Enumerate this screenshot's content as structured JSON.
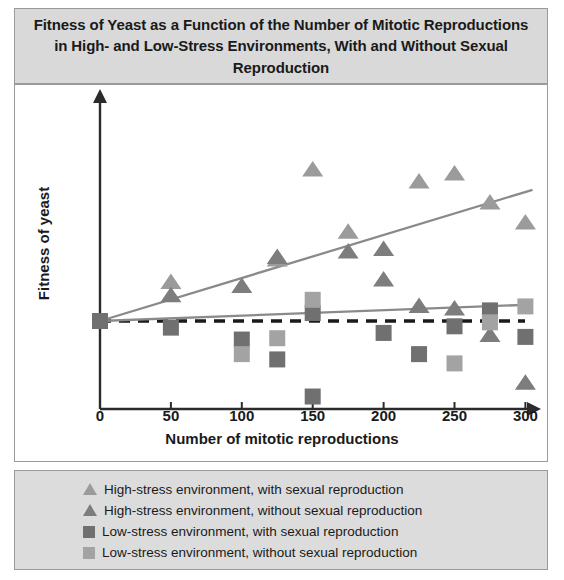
{
  "title": "Fitness of Yeast as a Function of the Number of Mitotic Reproductions in High- and Low-Stress Environments, With and Without Sexual Reproduction",
  "colors": {
    "high_with": "#9b9b9b",
    "high_without": "#7d7d7d",
    "low_with": "#707070",
    "low_without": "#a3a3a3",
    "trend_high": "#8a8a8a",
    "trend_low": "#8a8a8a",
    "baseline": "#1a1a1a",
    "axis": "#2b2b2b",
    "panel_title_bg": "#d9d9d9",
    "panel_legend_bg": "#dcdcdc",
    "panel_border": "#9a9a9a"
  },
  "legend": {
    "items": [
      {
        "marker": "triangle-icon",
        "color": "#9b9b9b",
        "label": "High-stress environment, with sexual reproduction"
      },
      {
        "marker": "triangle-icon",
        "color": "#7d7d7d",
        "label": "High-stress environment, without sexual reproduction"
      },
      {
        "marker": "square-icon",
        "color": "#707070",
        "label": "Low-stress environment, with sexual reproduction"
      },
      {
        "marker": "square-icon",
        "color": "#a3a3a3",
        "label": "Low-stress environment, without sexual reproduction"
      }
    ]
  },
  "chart_data": {
    "type": "scatter",
    "title": "Fitness of Yeast as a Function of the Number of Mitotic Reproductions in High- and Low-Stress Environments, With and Without Sexual Reproduction",
    "xlabel": "Number of mitotic reproductions",
    "ylabel": "Fitness of yeast",
    "xlim": [
      0,
      315
    ],
    "ylim": [
      -3.1,
      6.2
    ],
    "xticks": [
      0,
      50,
      100,
      150,
      200,
      250,
      300
    ],
    "yticks": [],
    "grid": false,
    "legend_position": "bottom",
    "baseline": {
      "value": 0,
      "style": "dashed",
      "label": "initial fitness"
    },
    "series": [
      {
        "name": "High-stress environment, with sexual reproduction",
        "marker": "triangle",
        "color": "#9b9b9b",
        "points": [
          {
            "x": 50,
            "y": 1.45
          },
          {
            "x": 125,
            "y": 2.3
          },
          {
            "x": 150,
            "y": 5.7
          },
          {
            "x": 175,
            "y": 3.35
          },
          {
            "x": 225,
            "y": 5.25
          },
          {
            "x": 250,
            "y": 5.55
          },
          {
            "x": 275,
            "y": 4.45
          },
          {
            "x": 300,
            "y": 3.7
          }
        ]
      },
      {
        "name": "High-stress environment, without sexual reproduction",
        "marker": "triangle",
        "color": "#7d7d7d",
        "points": [
          {
            "x": 50,
            "y": 0.95
          },
          {
            "x": 100,
            "y": 1.3
          },
          {
            "x": 125,
            "y": 2.4
          },
          {
            "x": 175,
            "y": 2.6
          },
          {
            "x": 200,
            "y": 2.7
          },
          {
            "x": 200,
            "y": 1.55
          },
          {
            "x": 225,
            "y": 0.55
          },
          {
            "x": 250,
            "y": 0.45
          },
          {
            "x": 275,
            "y": -0.55
          },
          {
            "x": 300,
            "y": -2.35
          }
        ]
      },
      {
        "name": "Low-stress environment, with sexual reproduction",
        "marker": "square",
        "color": "#707070",
        "points": [
          {
            "x": 0,
            "y": 0.0
          },
          {
            "x": 50,
            "y": -0.25
          },
          {
            "x": 100,
            "y": -0.7
          },
          {
            "x": 125,
            "y": -1.45
          },
          {
            "x": 150,
            "y": 0.3
          },
          {
            "x": 150,
            "y": -2.85
          },
          {
            "x": 200,
            "y": -0.45
          },
          {
            "x": 225,
            "y": -1.25
          },
          {
            "x": 250,
            "y": -0.2
          },
          {
            "x": 275,
            "y": 0.4
          },
          {
            "x": 300,
            "y": -0.6
          }
        ]
      },
      {
        "name": "Low-stress environment, without sexual reproduction",
        "marker": "square",
        "color": "#a3a3a3",
        "points": [
          {
            "x": 100,
            "y": -1.25
          },
          {
            "x": 125,
            "y": -0.65
          },
          {
            "x": 150,
            "y": 0.8
          },
          {
            "x": 250,
            "y": -1.6
          },
          {
            "x": 275,
            "y": -0.05
          },
          {
            "x": 300,
            "y": 0.55
          }
        ]
      }
    ],
    "trendlines": [
      {
        "name": "High-stress trend",
        "color": "#8a8a8a",
        "x0": 0,
        "y0": 0.0,
        "x1": 305,
        "y1": 4.95
      },
      {
        "name": "Low-stress trend",
        "color": "#8a8a8a",
        "x0": 0,
        "y0": 0.0,
        "x1": 305,
        "y1": 0.62
      }
    ]
  }
}
